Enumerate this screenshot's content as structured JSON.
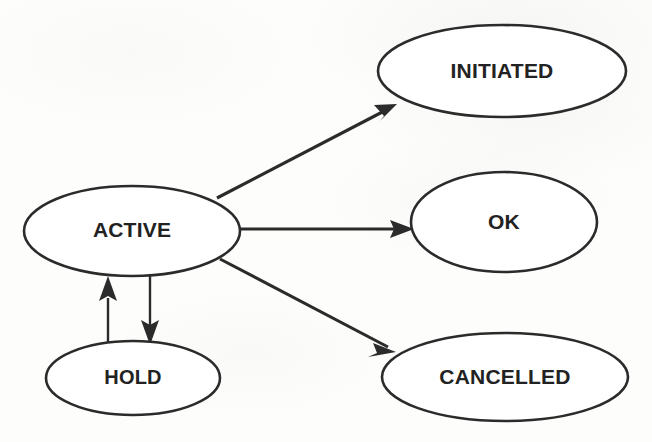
{
  "diagram": {
    "type": "state-diagram",
    "canvas": {
      "width": 652,
      "height": 442
    },
    "colors": {
      "paper": "#fdfdfc",
      "stroke": "#2b2b2b",
      "text": "#222222",
      "node_fill": "#ffffff"
    },
    "nodes": [
      {
        "id": "active",
        "label": "ACTIVE",
        "cx": 132,
        "cy": 231,
        "rx": 108,
        "ry": 45,
        "font_size": 21
      },
      {
        "id": "initiated",
        "label": "INITIATED",
        "cx": 502,
        "cy": 71,
        "rx": 124,
        "ry": 46,
        "font_size": 21
      },
      {
        "id": "ok",
        "label": "OK",
        "cx": 504,
        "cy": 222,
        "rx": 93,
        "ry": 50,
        "font_size": 21
      },
      {
        "id": "hold",
        "label": "HOLD",
        "cx": 133,
        "cy": 378,
        "rx": 87,
        "ry": 37,
        "font_size": 20
      },
      {
        "id": "cancelled",
        "label": "CANCELLED",
        "cx": 505,
        "cy": 377,
        "rx": 123,
        "ry": 44,
        "font_size": 21
      }
    ],
    "edges": [
      {
        "id": "active-to-initiated",
        "from": "ACTIVE",
        "to": "INITIATED",
        "label": "",
        "x1": 217,
        "y1": 198,
        "x2": 394,
        "y2": 107,
        "arrow": "end"
      },
      {
        "id": "active-to-ok",
        "from": "ACTIVE",
        "to": "OK",
        "label": "",
        "x1": 239,
        "y1": 229,
        "x2": 412,
        "y2": 229,
        "arrow": "end"
      },
      {
        "id": "active-to-cancelled",
        "from": "ACTIVE",
        "to": "CANCELLED",
        "label": "",
        "x1": 220,
        "y1": 259,
        "x2": 392,
        "y2": 349,
        "arrow": "end"
      },
      {
        "id": "active-to-hold",
        "from": "ACTIVE",
        "to": "HOLD",
        "label": "",
        "x1": 150,
        "y1": 276,
        "x2": 150,
        "y2": 344,
        "arrow": "end"
      },
      {
        "id": "hold-to-active",
        "from": "HOLD",
        "to": "ACTIVE",
        "label": "",
        "x1": 108,
        "y1": 348,
        "x2": 108,
        "y2": 277,
        "arrow": "end"
      }
    ]
  }
}
